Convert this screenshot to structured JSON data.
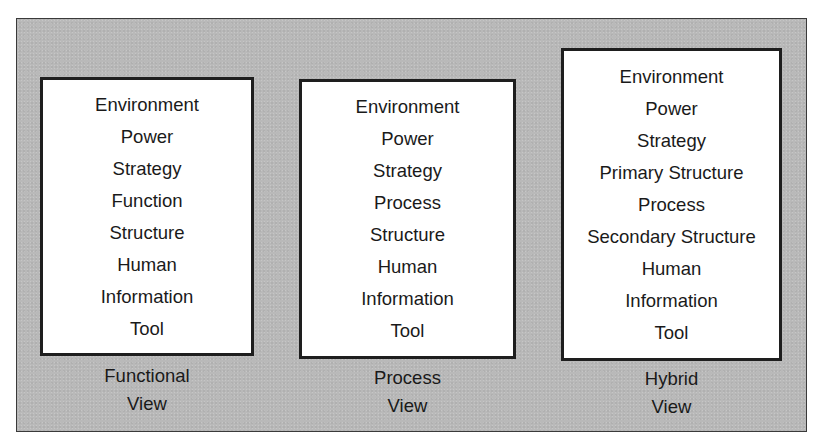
{
  "views": [
    {
      "id": "functional",
      "caption_line1": "Functional",
      "caption_line2": "View",
      "items": [
        "Environment",
        "Power",
        "Strategy",
        "Function",
        "Structure",
        "Human",
        "Information",
        "Tool"
      ]
    },
    {
      "id": "process",
      "caption_line1": "Process",
      "caption_line2": "View",
      "items": [
        "Environment",
        "Power",
        "Strategy",
        "Process",
        "Structure",
        "Human",
        "Information",
        "Tool"
      ]
    },
    {
      "id": "hybrid",
      "caption_line1": "Hybrid",
      "caption_line2": "View",
      "items": [
        "Environment",
        "Power",
        "Strategy",
        "Primary Structure",
        "Process",
        "Secondary Structure",
        "Human",
        "Information",
        "Tool"
      ]
    }
  ],
  "colors": {
    "frame_background": "#b9b9b9",
    "box_background": "#ffffff",
    "border": "#1e1e1e",
    "text": "#1a1a1a"
  }
}
